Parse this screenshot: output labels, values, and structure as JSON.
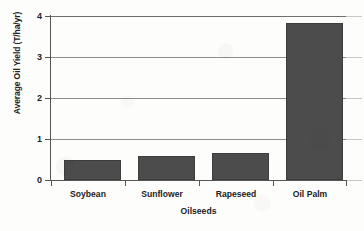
{
  "chart_data": {
    "type": "bar",
    "title": "",
    "categories": [
      "Soybean",
      "Sunflower",
      "Rapeseed",
      "Oil Palm"
    ],
    "values": [
      0.48,
      0.58,
      0.66,
      3.83
    ],
    "xlabel": "Oilseeds",
    "ylabel": "Average Oil Yield (T/ha/yr)",
    "ylim": [
      0,
      4
    ],
    "yticks": [
      0,
      1,
      2,
      3,
      4
    ],
    "ytick_labels": [
      "0",
      "1",
      "2",
      "3",
      "4"
    ],
    "grid": true,
    "grid_axis": "y",
    "legend": false,
    "legend_position": "none",
    "bar_color": "#4c4c4c",
    "bar_edge_color": "#3d3d3d",
    "axis_color": "#555555",
    "gridline_color": "#8d8d8d",
    "background_color": "#fdfdfc",
    "series": [
      {
        "name": "Average Oil Yield",
        "values": [
          0.48,
          0.58,
          0.66,
          3.83
        ]
      }
    ]
  }
}
